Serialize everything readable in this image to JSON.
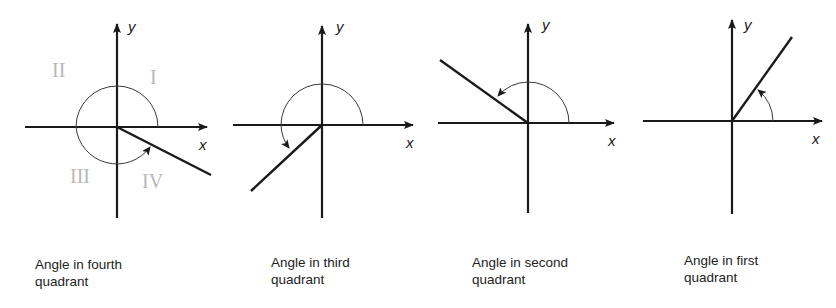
{
  "figure": {
    "panels": [
      {
        "id": "fourth",
        "axis_labels": {
          "x": "x",
          "y": "y"
        },
        "quadrant_marks": [
          "II",
          "I",
          "III",
          "IV"
        ],
        "caption_line1": "Angle in fourth",
        "caption_line2": "quadrant"
      },
      {
        "id": "third",
        "axis_labels": {
          "x": "x",
          "y": "y"
        },
        "caption_line1": "Angle in third",
        "caption_line2": "quadrant"
      },
      {
        "id": "second",
        "axis_labels": {
          "x": "x",
          "y": "y"
        },
        "caption_line1": "Angle in second",
        "caption_line2": "quadrant"
      },
      {
        "id": "first",
        "axis_labels": {
          "x": "x",
          "y": "y"
        },
        "caption_line1": "Angle in first",
        "caption_line2": "quadrant"
      }
    ]
  }
}
